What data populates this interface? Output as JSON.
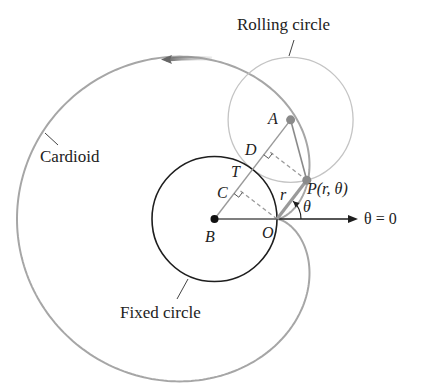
{
  "labels": {
    "rolling_circle": "Rolling circle",
    "cardioid": "Cardioid",
    "fixed_circle": "Fixed circle",
    "A": "A",
    "B": "B",
    "C": "C",
    "D": "D",
    "T": "T",
    "O": "O",
    "r": "r",
    "P": "P(r, θ)",
    "theta": "θ",
    "polar_axis": "θ = 0"
  },
  "geometry": {
    "origin_O": [
      277,
      219
    ],
    "circle_radius_a": 62.5,
    "cardioid_equation": "r = 2a(1 − cos θ)",
    "cardioid_x_stretch": 1.04,
    "theta_deg": 52.5,
    "polar_axis_end_x": 358
  },
  "colors": {
    "ink": "#1e1e1e",
    "cardioid": "#a6a6a6",
    "rolling_circle": "#c4c4c4",
    "construction": "#9a9a9a",
    "point": "#8a8a8a"
  }
}
